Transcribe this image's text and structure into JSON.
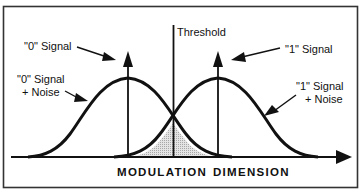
{
  "diagram": {
    "labels": {
      "threshold": "Threshold",
      "zero_signal": "\"0\" Signal",
      "zero_signal_noise_line1": "\"0\" Signal",
      "zero_signal_noise_line2": "+ Noise",
      "one_signal": "\"1\" Signal",
      "one_signal_noise_line1": "\"1\"  Signal",
      "one_signal_noise_line2": "+ Noise",
      "axis_left": "MODULATION",
      "axis_right": "DIMENSION"
    },
    "elements": {
      "curves": [
        "\"0\" Signal + Noise distribution",
        "\"1\" Signal + Noise distribution"
      ],
      "signal_arrows": [
        "\"0\" Signal impulse",
        "\"1\" Signal impulse"
      ],
      "threshold_line": "vertical line between the two distributions",
      "overlap_region": "shaded area (error region) under both curves"
    },
    "colors": {
      "line": "#111111",
      "shade": "#d6d6d6",
      "frame": "#333333",
      "background": "#ffffff"
    }
  }
}
